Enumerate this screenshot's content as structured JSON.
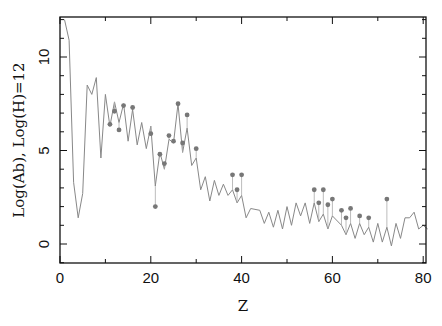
{
  "chart_data": {
    "type": "line",
    "title": "",
    "xlabel": "Z",
    "ylabel": "Log(Ab), Log(H)=12",
    "xlim": [
      0,
      81
    ],
    "ylim": [
      -1,
      12
    ],
    "xticks": [
      0,
      20,
      40,
      60,
      80
    ],
    "yticks": [
      0,
      5,
      10
    ],
    "grid": false,
    "series": [
      {
        "name": "solar abundances",
        "style": "line",
        "color": "#888888",
        "x": [
          1,
          2,
          3,
          4,
          5,
          6,
          7,
          8,
          9,
          10,
          11,
          12,
          13,
          14,
          15,
          16,
          17,
          18,
          19,
          20,
          21,
          22,
          23,
          24,
          25,
          26,
          27,
          28,
          29,
          30,
          31,
          32,
          33,
          34,
          35,
          36,
          37,
          38,
          39,
          40,
          41,
          42,
          44,
          45,
          46,
          47,
          48,
          49,
          50,
          51,
          52,
          53,
          54,
          55,
          56,
          57,
          58,
          59,
          60,
          62,
          63,
          64,
          65,
          66,
          67,
          68,
          69,
          70,
          71,
          72,
          73,
          74,
          75,
          76,
          77,
          78,
          79,
          80,
          81
        ],
        "y": [
          12.0,
          10.9,
          3.3,
          1.4,
          2.7,
          8.5,
          8.0,
          8.9,
          4.6,
          8.0,
          6.3,
          7.6,
          6.5,
          7.5,
          5.5,
          7.2,
          5.3,
          6.5,
          5.1,
          6.3,
          3.1,
          4.9,
          4.0,
          5.6,
          5.4,
          7.5,
          4.9,
          6.2,
          4.2,
          4.6,
          2.9,
          3.6,
          2.3,
          3.4,
          2.6,
          3.2,
          2.6,
          2.9,
          2.2,
          2.6,
          1.4,
          1.9,
          1.8,
          1.1,
          1.7,
          0.9,
          1.8,
          0.8,
          2.0,
          1.0,
          2.2,
          1.5,
          2.2,
          1.1,
          2.2,
          1.2,
          1.6,
          0.8,
          1.5,
          1.0,
          0.5,
          1.1,
          0.3,
          1.1,
          0.5,
          0.9,
          0.1,
          1.1,
          0.1,
          0.9,
          -0.1,
          1.1,
          0.3,
          1.4,
          1.4,
          1.7,
          0.8,
          1.0,
          0.8
        ]
      },
      {
        "name": "measured abundances",
        "style": "points",
        "color": "#777777",
        "x": [
          11,
          12,
          13,
          14,
          16,
          20,
          21,
          22,
          23,
          24,
          25,
          26,
          27,
          28,
          30,
          38,
          39,
          40,
          56,
          57,
          58,
          59,
          60,
          62,
          63,
          64,
          66,
          68,
          72
        ],
        "y": [
          6.4,
          7.1,
          6.1,
          7.4,
          7.3,
          5.9,
          2.0,
          4.8,
          4.3,
          5.8,
          5.5,
          7.5,
          5.4,
          6.9,
          5.1,
          3.7,
          2.9,
          3.7,
          2.9,
          2.2,
          2.9,
          2.1,
          2.4,
          1.8,
          1.4,
          1.9,
          1.5,
          1.4,
          2.4
        ]
      }
    ]
  }
}
